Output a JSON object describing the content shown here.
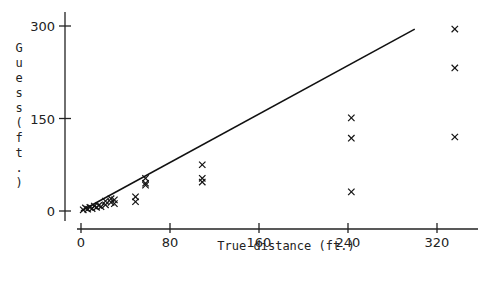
{
  "chart_data": {
    "type": "scatter",
    "title": "",
    "xlabel": "True distance (ft.)",
    "ylabel": "Guess (ft.)",
    "xlim": [
      0,
      360
    ],
    "ylim": [
      0,
      300
    ],
    "x_ticks": [
      0,
      80,
      160,
      240,
      320
    ],
    "y_ticks": [
      0,
      150,
      300
    ],
    "grid": false,
    "legend": null,
    "marker": "x",
    "reference_line": {
      "x": [
        0,
        300
      ],
      "y": [
        0,
        295
      ],
      "label": "y = x"
    },
    "series": [
      {
        "name": "Guesses",
        "points": [
          [
            2,
            2
          ],
          [
            4,
            5
          ],
          [
            6,
            3
          ],
          [
            8,
            6
          ],
          [
            10,
            4
          ],
          [
            12,
            8
          ],
          [
            14,
            6
          ],
          [
            16,
            9
          ],
          [
            18,
            7
          ],
          [
            22,
            10
          ],
          [
            22,
            16
          ],
          [
            27,
            14
          ],
          [
            27,
            20
          ],
          [
            30,
            12
          ],
          [
            30,
            18
          ],
          [
            49,
            15
          ],
          [
            49,
            23
          ],
          [
            58,
            42
          ],
          [
            58,
            45
          ],
          [
            58,
            53
          ],
          [
            109,
            47
          ],
          [
            109,
            53
          ],
          [
            109,
            75
          ],
          [
            243,
            31
          ],
          [
            243,
            118
          ],
          [
            243,
            151
          ],
          [
            336,
            120
          ],
          [
            336,
            232
          ],
          [
            336,
            295
          ]
        ]
      }
    ]
  },
  "labels": {
    "x_axis_title": "True distance (ft.)",
    "y_axis_chars": [
      "G",
      "u",
      "e",
      "s",
      "s",
      "(",
      "f",
      "t",
      ".",
      ")"
    ],
    "x_tick_labels": [
      "0",
      "80",
      "160",
      "240",
      "320"
    ],
    "y_tick_labels": [
      "0",
      "150",
      "300"
    ]
  }
}
